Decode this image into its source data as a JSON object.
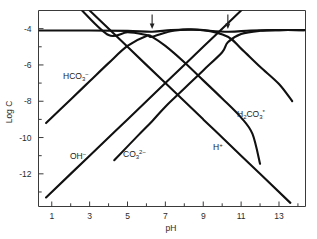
{
  "figure": {
    "background_color": "#ffffff",
    "line_color": "#111111",
    "axis_color": "#3a3a3a"
  },
  "chart_data": {
    "type": "line",
    "title": "",
    "xlabel": "pH",
    "ylabel": "Log C",
    "xlim": [
      0.3,
      14.4
    ],
    "ylim": [
      -13.8,
      -3.0
    ],
    "grid": false,
    "legend": "inline-labels",
    "x_ticks_major": [
      1,
      3,
      5,
      7,
      9,
      11,
      13
    ],
    "x_ticks_minor": [
      2,
      4,
      6,
      8,
      10,
      12,
      14
    ],
    "y_ticks_major": [
      -4,
      -6,
      -8,
      -10,
      -12
    ],
    "y_ticks_minor": [
      -5,
      -7,
      -9,
      -11,
      -13
    ],
    "x_tick_labels": [
      "1",
      "3",
      "5",
      "7",
      "9",
      "11",
      "13"
    ],
    "y_tick_labels": [
      "-4",
      "-6",
      "-8",
      "-10",
      "-12"
    ],
    "annotations": [
      {
        "name": "pk1-arrow",
        "x": 6.3,
        "label": ""
      },
      {
        "name": "pk2-arrow",
        "x": 10.3,
        "label": ""
      }
    ],
    "series": [
      {
        "name": "CT",
        "label": "",
        "points": [
          [
            0.35,
            -4.1
          ],
          [
            3.0,
            -4.1
          ],
          [
            5.0,
            -4.12
          ],
          [
            6.3,
            -4.17
          ],
          [
            7.3,
            -4.08
          ],
          [
            8.5,
            -4.06
          ],
          [
            10.3,
            -4.17
          ],
          [
            11.5,
            -4.1
          ],
          [
            13.0,
            -4.08
          ],
          [
            14.35,
            -4.08
          ]
        ]
      },
      {
        "name": "H2CO3",
        "label": "H2CO3*",
        "points": [
          [
            2.6,
            -3.0
          ],
          [
            4.0,
            -4.35
          ],
          [
            5.0,
            -4.2
          ],
          [
            6.0,
            -4.35
          ],
          [
            6.3,
            -4.45
          ],
          [
            7.0,
            -4.95
          ],
          [
            8.0,
            -5.85
          ],
          [
            9.0,
            -6.85
          ],
          [
            10.0,
            -7.85
          ],
          [
            11.0,
            -8.9
          ],
          [
            11.6,
            -9.8
          ],
          [
            12.0,
            -11.45
          ]
        ]
      },
      {
        "name": "HCO3",
        "label": "HCO3-",
        "points": [
          [
            0.7,
            -9.2
          ],
          [
            2.0,
            -7.9
          ],
          [
            3.0,
            -6.9
          ],
          [
            4.0,
            -5.9
          ],
          [
            5.0,
            -4.95
          ],
          [
            6.0,
            -4.4
          ],
          [
            6.3,
            -4.45
          ],
          [
            7.5,
            -4.1
          ],
          [
            9.0,
            -4.08
          ],
          [
            10.3,
            -4.45
          ],
          [
            11.0,
            -5.1
          ],
          [
            12.0,
            -6.1
          ],
          [
            13.0,
            -7.05
          ],
          [
            13.7,
            -8.0
          ]
        ]
      },
      {
        "name": "CO3",
        "label": "CO3 2-",
        "points": [
          [
            4.3,
            -11.25
          ],
          [
            5.5,
            -9.95
          ],
          [
            6.3,
            -9.1
          ],
          [
            7.0,
            -8.3
          ],
          [
            8.0,
            -7.3
          ],
          [
            9.0,
            -6.3
          ],
          [
            10.0,
            -5.3
          ],
          [
            10.3,
            -4.75
          ],
          [
            11.0,
            -4.3
          ],
          [
            12.0,
            -4.12
          ],
          [
            13.0,
            -4.08
          ],
          [
            14.35,
            -4.08
          ]
        ]
      },
      {
        "name": "H+",
        "label": "H+",
        "points": [
          [
            0.45,
            -0.45
          ],
          [
            3.0,
            -3.0
          ],
          [
            5.0,
            -5.0
          ],
          [
            7.0,
            -7.0
          ],
          [
            9.0,
            -9.0
          ],
          [
            11.0,
            -11.0
          ],
          [
            13.6,
            -13.6
          ]
        ]
      },
      {
        "name": "OH-",
        "label": "OH-",
        "points": [
          [
            0.7,
            -13.3
          ],
          [
            3.0,
            -11.0
          ],
          [
            5.0,
            -9.0
          ],
          [
            7.0,
            -7.0
          ],
          [
            9.0,
            -5.0
          ],
          [
            11.0,
            -3.0
          ],
          [
            11.45,
            -2.55
          ]
        ]
      }
    ]
  },
  "labels": {
    "y_axis_title": "Log C",
    "x_axis_title": "pH",
    "species": {
      "hco3": {
        "base": "HCO",
        "sub": "3",
        "sup": "−"
      },
      "co3": {
        "base": "CO",
        "sub": "3",
        "sup": "2−"
      },
      "h2co3": {
        "pre_sub": "2",
        "base_a": "H",
        "base_b": "CO",
        "sub": "3",
        "sup": "*"
      },
      "oh": {
        "base": "OH",
        "sup": "−"
      },
      "h": {
        "base": "H",
        "sup": "+"
      }
    }
  }
}
